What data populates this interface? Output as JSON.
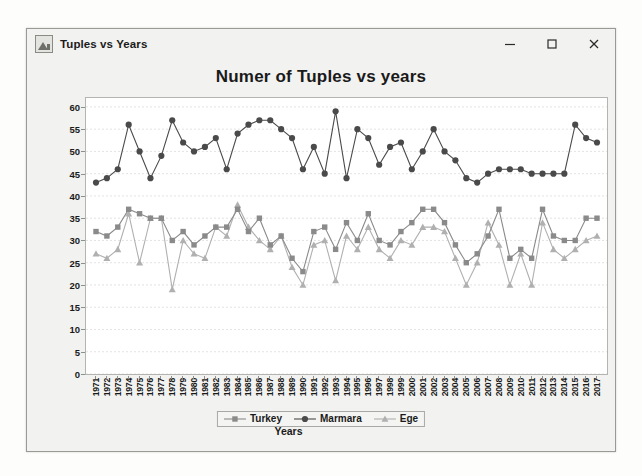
{
  "window": {
    "title": "Tuples vs Years",
    "icon": "chart-app-icon",
    "buttons": {
      "minimize": "minimize-button",
      "maximize": "maximize-button",
      "close": "close-button"
    }
  },
  "chart_data": {
    "type": "line",
    "title": "Numer of Tuples vs years",
    "xlabel": "Years",
    "ylabel": "Number of Tuples",
    "ylim": [
      0,
      62
    ],
    "yticks": [
      0,
      5,
      10,
      15,
      20,
      25,
      30,
      35,
      40,
      45,
      50,
      55,
      60
    ],
    "grid": true,
    "legend_position": "bottom",
    "categories": [
      "1971",
      "1972",
      "1973",
      "1974",
      "1975",
      "1976",
      "1977",
      "1978",
      "1979",
      "1980",
      "1981",
      "1982",
      "1983",
      "1984",
      "1985",
      "1986",
      "1987",
      "1988",
      "1989",
      "1990",
      "1991",
      "1992",
      "1993",
      "1994",
      "1995",
      "1996",
      "1997",
      "1998",
      "1999",
      "2000",
      "2001",
      "2002",
      "2003",
      "2004",
      "2005",
      "2006",
      "2007",
      "2008",
      "2009",
      "2010",
      "2011",
      "2012",
      "2013",
      "2014",
      "2015",
      "2016",
      "2017"
    ],
    "series": [
      {
        "name": "Turkey",
        "color": "#8a8a8a",
        "marker": "square",
        "values": [
          32,
          31,
          33,
          37,
          36,
          35,
          35,
          30,
          32,
          29,
          31,
          33,
          33,
          37,
          32,
          35,
          29,
          31,
          26,
          23,
          32,
          33,
          28,
          34,
          30,
          36,
          30,
          29,
          32,
          34,
          37,
          37,
          34,
          29,
          25,
          27,
          31,
          37,
          26,
          28,
          26,
          37,
          31,
          30,
          30,
          35,
          35
        ]
      },
      {
        "name": "Marmara",
        "color": "#4a4a4a",
        "marker": "circle",
        "values": [
          43,
          44,
          46,
          56,
          50,
          44,
          49,
          57,
          52,
          50,
          51,
          53,
          46,
          54,
          56,
          57,
          57,
          55,
          53,
          46,
          51,
          45,
          59,
          44,
          55,
          53,
          47,
          51,
          52,
          46,
          50,
          55,
          50,
          48,
          44,
          43,
          45,
          46,
          46,
          46,
          45,
          45,
          45,
          45,
          56,
          53,
          52
        ]
      },
      {
        "name": "Ege",
        "color": "#b0b0b0",
        "marker": "triangle",
        "values": [
          27,
          26,
          28,
          36,
          25,
          35,
          35,
          19,
          30,
          27,
          26,
          33,
          31,
          38,
          33,
          30,
          28,
          31,
          24,
          20,
          29,
          30,
          21,
          31,
          28,
          33,
          28,
          26,
          30,
          29,
          33,
          33,
          32,
          26,
          20,
          25,
          34,
          29,
          20,
          27,
          20,
          34,
          28,
          26,
          28,
          30,
          31
        ]
      }
    ]
  }
}
